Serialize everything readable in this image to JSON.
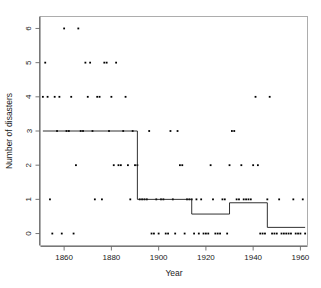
{
  "chart_data": {
    "type": "scatter",
    "title": "",
    "xlabel": "Year",
    "ylabel": "Number of disasters",
    "xlim": [
      1850,
      1963
    ],
    "ylim": [
      -0.35,
      6.35
    ],
    "grid": false,
    "legend": null,
    "xticks": [
      1860,
      1880,
      1900,
      1920,
      1940,
      1960
    ],
    "xtick_labels": [
      "1860",
      "1880",
      "1900",
      "1920",
      "1940",
      "1960"
    ],
    "yticks": [
      0,
      1,
      2,
      3,
      4,
      5,
      6
    ],
    "ytick_labels": [
      "0",
      "1",
      "2",
      "3",
      "4",
      "5",
      "6"
    ],
    "series": [
      {
        "name": "disasters",
        "type": "scatter",
        "marker": "point",
        "color": "#000000",
        "x": [
          1851,
          1852,
          1853,
          1854,
          1855,
          1856,
          1857,
          1858,
          1859,
          1860,
          1861,
          1862,
          1863,
          1864,
          1865,
          1866,
          1867,
          1868,
          1869,
          1870,
          1871,
          1872,
          1873,
          1874,
          1875,
          1876,
          1877,
          1878,
          1879,
          1880,
          1881,
          1882,
          1883,
          1884,
          1885,
          1886,
          1887,
          1888,
          1889,
          1890,
          1891,
          1892,
          1893,
          1894,
          1895,
          1896,
          1897,
          1898,
          1899,
          1900,
          1901,
          1902,
          1903,
          1904,
          1905,
          1906,
          1907,
          1908,
          1909,
          1910,
          1911,
          1912,
          1913,
          1914,
          1915,
          1916,
          1917,
          1918,
          1919,
          1920,
          1921,
          1922,
          1923,
          1924,
          1925,
          1926,
          1927,
          1928,
          1929,
          1930,
          1931,
          1932,
          1933,
          1934,
          1935,
          1936,
          1937,
          1938,
          1939,
          1940,
          1941,
          1942,
          1943,
          1944,
          1945,
          1946,
          1947,
          1948,
          1949,
          1950,
          1951,
          1952,
          1953,
          1954,
          1955,
          1956,
          1957,
          1958,
          1959,
          1960,
          1961,
          1962
        ],
        "y": [
          4,
          5,
          4,
          1,
          0,
          4,
          3,
          4,
          0,
          6,
          3,
          3,
          4,
          0,
          2,
          6,
          3,
          3,
          5,
          4,
          5,
          3,
          1,
          4,
          4,
          1,
          5,
          5,
          3,
          4,
          2,
          5,
          2,
          2,
          3,
          4,
          2,
          1,
          3,
          2,
          2,
          1,
          1,
          1,
          1,
          3,
          0,
          0,
          1,
          0,
          1,
          1,
          0,
          0,
          3,
          1,
          0,
          3,
          2,
          2,
          0,
          1,
          1,
          1,
          0,
          1,
          0,
          1,
          0,
          0,
          0,
          2,
          1,
          0,
          0,
          0,
          1,
          1,
          0,
          2,
          3,
          3,
          1,
          1,
          2,
          1,
          1,
          1,
          1,
          2,
          4,
          2,
          0,
          0,
          0,
          1,
          4,
          0,
          0,
          0,
          1,
          0,
          0,
          0,
          0,
          0,
          1,
          0,
          0,
          0,
          1,
          0
        ]
      },
      {
        "name": "fitted step function",
        "type": "step",
        "color": "#1a1a1a",
        "segments": [
          {
            "x_start": 1851,
            "x_end": 1891,
            "value": 3.0
          },
          {
            "x_start": 1891,
            "x_end": 1914,
            "value": 1.0
          },
          {
            "x_start": 1914,
            "x_end": 1930,
            "value": 0.57
          },
          {
            "x_start": 1930,
            "x_end": 1946,
            "value": 0.9
          },
          {
            "x_start": 1946,
            "x_end": 1962,
            "value": 0.18
          }
        ]
      }
    ]
  },
  "axes": {
    "x_title": "Year",
    "y_title": "Number of disasters"
  },
  "colors": {
    "point": "#000000",
    "step": "#1a1a1a",
    "frame": "#999999",
    "axis": "#555555",
    "background": "#ffffff"
  }
}
